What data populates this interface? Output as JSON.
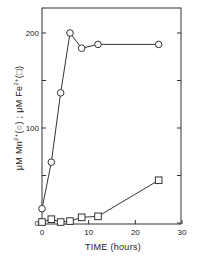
{
  "chart_data": {
    "type": "line",
    "title": "",
    "xlabel": "TIME (hours)",
    "ylabel": "μM Mn2+(○) ; μM Fe2+(□)",
    "ylabel_parts": {
      "mn_prefix": "μM Mn",
      "mn_sup": "2+",
      "mn_marker": "(○)",
      "sep": " ; ",
      "fe_prefix": "μM Fe",
      "fe_sup": "2+",
      "fe_marker": "(□)"
    },
    "xlim": [
      0,
      30
    ],
    "ylim": [
      0,
      230
    ],
    "x_ticks": [
      0,
      10,
      20,
      30
    ],
    "x_tick_labels": [
      "0",
      "10",
      "20",
      "30"
    ],
    "y_ticks": [
      0,
      50,
      100,
      150,
      200
    ],
    "y_tick_labels": [
      "0",
      "",
      "100",
      "",
      "200"
    ],
    "grid": false,
    "legend": "none (markers described in y-axis label)",
    "series": [
      {
        "name": "Mn2+",
        "marker": "circle",
        "x": [
          0,
          2,
          4,
          6,
          8.5,
          12,
          25
        ],
        "y": [
          15,
          64,
          137,
          200,
          184,
          188,
          188
        ]
      },
      {
        "name": "Fe2+",
        "marker": "square",
        "x": [
          0,
          2,
          4,
          6,
          8.5,
          12,
          25
        ],
        "y": [
          1,
          4,
          1,
          2,
          6,
          7,
          45
        ]
      }
    ]
  }
}
